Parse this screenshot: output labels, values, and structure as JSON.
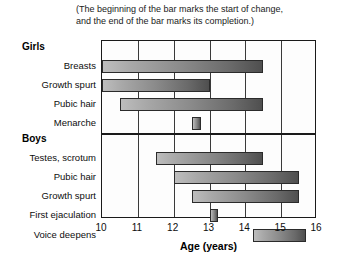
{
  "caption": {
    "line1": "(The beginning of the bar marks the start of change,",
    "line2": "and the end of the bar marks its completion.)"
  },
  "groups": {
    "girls": "Girls",
    "boys": "Boys"
  },
  "axis": {
    "title": "Age (years)",
    "ticks": [
      "10",
      "11",
      "12",
      "13",
      "14",
      "15",
      "16"
    ]
  },
  "colors": {
    "bar_start": "#bdbdbd",
    "bar_end": "#4f4f4f",
    "border": "#1a1a1a",
    "grid": "#3a3a3a",
    "background": "#ffffff"
  },
  "chart_data": {
    "type": "bar",
    "orientation": "horizontal",
    "subtype": "range-bar",
    "title": "",
    "subtitle": "(The beginning of the bar marks the start of change, and the end of the bar marks its completion.)",
    "xlabel": "Age (years)",
    "ylabel": "",
    "xlim": [
      10,
      16
    ],
    "xticks": [
      10,
      11,
      12,
      13,
      14,
      15,
      16
    ],
    "grid": true,
    "grid_axis": "x",
    "legend": false,
    "groups": [
      {
        "name": "Girls",
        "items": [
          {
            "label": "Breasts",
            "start": 10.0,
            "end": 14.5
          },
          {
            "label": "Growth spurt",
            "start": 10.0,
            "end": 13.0
          },
          {
            "label": "Pubic hair",
            "start": 10.5,
            "end": 14.5
          },
          {
            "label": "Menarche",
            "start": 12.5,
            "end": 12.75
          }
        ]
      },
      {
        "name": "Boys",
        "items": [
          {
            "label": "Testes, scrotum",
            "start": 11.5,
            "end": 14.5
          },
          {
            "label": "Pubic hair",
            "start": 12.0,
            "end": 15.5
          },
          {
            "label": "Growth spurt",
            "start": 12.5,
            "end": 15.5
          },
          {
            "label": "First ejaculation",
            "start": 13.0,
            "end": 13.25
          },
          {
            "label": "Voice deepens",
            "start": 14.2,
            "end": 15.7
          }
        ]
      }
    ]
  }
}
